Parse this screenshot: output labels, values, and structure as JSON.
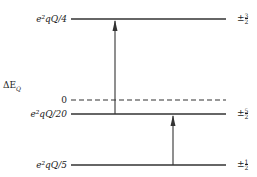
{
  "diagram": {
    "axis_label": "ΔE",
    "axis_label_sub": "Q",
    "levels": [
      {
        "energy_label": "e²qQ/4",
        "m_label_sign": "±",
        "m_num": "3",
        "m_den": "2",
        "y": 19,
        "style": "solid"
      },
      {
        "energy_label": "0",
        "m_label_sign": "",
        "m_num": "",
        "m_den": "",
        "y": 100,
        "style": "dashed"
      },
      {
        "energy_label": "e²qQ/20",
        "m_label_sign": "±",
        "m_num": "5",
        "m_den": "2",
        "y": 114,
        "style": "solid"
      },
      {
        "energy_label": "e²qQ/5",
        "m_label_sign": "±",
        "m_num": "1",
        "m_den": "2",
        "y": 165,
        "style": "solid"
      }
    ],
    "transitions": [
      {
        "from": "±5/2",
        "to": "±3/2",
        "x": 115
      },
      {
        "from": "±1/2",
        "to": "±5/2",
        "x": 173
      }
    ],
    "line_color": "#333333"
  }
}
